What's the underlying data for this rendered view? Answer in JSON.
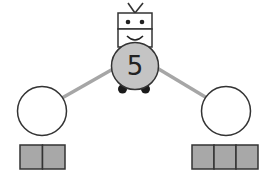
{
  "diagram": {
    "type": "number-bond-robot",
    "whole": {
      "value": "5",
      "label": "robot-body-number"
    },
    "parts": [
      {
        "position": "left",
        "value": "",
        "blocks": 2
      },
      {
        "position": "right",
        "value": "",
        "blocks": 3
      }
    ],
    "colors": {
      "body_fill": "#c4c4c4",
      "block_fill": "#a8a8a8",
      "outline": "#333333",
      "arm": "#a6a6a6",
      "wheel": "#1a1a1a",
      "background": "#ffffff"
    }
  }
}
